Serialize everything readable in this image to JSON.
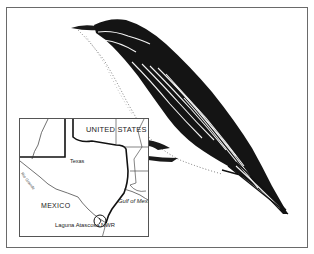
{
  "figure": {
    "illustration_icon": "bird-illustration-icon"
  },
  "map": {
    "labels": {
      "united_states": "UNITED STATES",
      "texas": "Texas",
      "mexico": "MEXICO",
      "gulf": "Gulf of Mexico",
      "site": "Laguna Atascosa NWR",
      "river": "Rio Grande"
    },
    "marker_icon": "location-circle-icon",
    "colors": {
      "ink": "#111111",
      "border": "#555555",
      "frame": "#6a6a6a"
    }
  }
}
